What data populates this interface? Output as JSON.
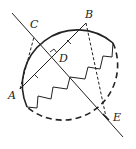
{
  "diagram": {
    "type": "geometry",
    "colors": {
      "stroke": "#222222",
      "background": "#ffffff"
    },
    "points": {
      "A": {
        "label": "A",
        "x": 20,
        "y": 89
      },
      "B": {
        "label": "B",
        "x": 86,
        "y": 23
      },
      "C": {
        "label": "C",
        "x": 34,
        "y": 37
      },
      "D": {
        "label": "D",
        "x": 53,
        "y": 56
      },
      "E": {
        "label": "E",
        "x": 106,
        "y": 117
      }
    },
    "circle": {
      "cx": 72,
      "cy": 77,
      "r": 55
    },
    "segments": [
      {
        "from": "A",
        "to": "B",
        "style": "solid",
        "note": "chord with equal-length tick marks on AD and DB"
      },
      {
        "from": "C",
        "to": "E",
        "style": "solid",
        "note": "line extended beyond C and E, perpendicular to AB at D"
      },
      {
        "from": "A",
        "to": "C",
        "style": "dashed"
      },
      {
        "from": "B",
        "to": "E",
        "style": "dashed"
      }
    ],
    "marks": [
      "right-angle at D",
      "tick on AD",
      "tick on DB"
    ]
  }
}
